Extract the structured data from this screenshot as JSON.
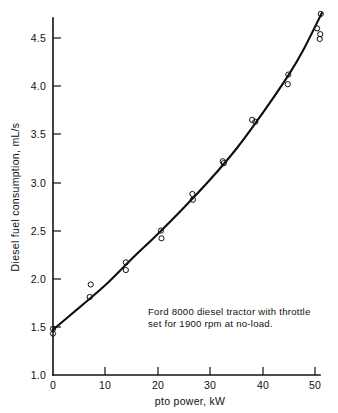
{
  "chart_data": {
    "type": "scatter",
    "title": "",
    "xlabel": "pto power, kW",
    "ylabel": "Diesel fuel consumption, mL/s",
    "xlim": [
      0,
      52
    ],
    "ylim": [
      1.0,
      4.8
    ],
    "xticks": [
      0,
      10,
      20,
      30,
      40,
      50
    ],
    "xtick_labels": [
      "0",
      "10",
      "20",
      "30",
      "40",
      "50"
    ],
    "yticks": [
      1.0,
      1.5,
      2.0,
      2.5,
      3.0,
      3.5,
      4.0,
      4.5
    ],
    "ytick_labels": [
      "1.0",
      "1.5",
      "2.0",
      "2.5",
      "3.0",
      "3.5",
      "4.0",
      "4.5"
    ],
    "grid": false,
    "legend": null,
    "annotations": [
      "Ford 8000 diesel tractor with throttle",
      "set for 1900 rpm at no-load."
    ],
    "points": [
      {
        "x": 0.0,
        "y": 1.48
      },
      {
        "x": 0.0,
        "y": 1.43
      },
      {
        "x": 7.2,
        "y": 1.94
      },
      {
        "x": 7.0,
        "y": 1.81
      },
      {
        "x": 13.9,
        "y": 2.17
      },
      {
        "x": 13.9,
        "y": 2.09
      },
      {
        "x": 20.6,
        "y": 2.5
      },
      {
        "x": 20.7,
        "y": 2.42
      },
      {
        "x": 26.6,
        "y": 2.88
      },
      {
        "x": 26.7,
        "y": 2.82
      },
      {
        "x": 32.4,
        "y": 3.22
      },
      {
        "x": 32.6,
        "y": 3.2
      },
      {
        "x": 38.0,
        "y": 3.65
      },
      {
        "x": 38.6,
        "y": 3.63
      },
      {
        "x": 44.9,
        "y": 4.12
      },
      {
        "x": 44.8,
        "y": 4.02
      },
      {
        "x": 51.1,
        "y": 4.75
      },
      {
        "x": 50.4,
        "y": 4.6
      },
      {
        "x": 51.0,
        "y": 4.54
      },
      {
        "x": 50.9,
        "y": 4.49
      }
    ],
    "fit_curve": [
      {
        "x": 0.0,
        "y": 1.47
      },
      {
        "x": 5.0,
        "y": 1.7
      },
      {
        "x": 10.0,
        "y": 1.935
      },
      {
        "x": 15.0,
        "y": 2.205
      },
      {
        "x": 20.0,
        "y": 2.465
      },
      {
        "x": 25.0,
        "y": 2.74
      },
      {
        "x": 30.0,
        "y": 3.03
      },
      {
        "x": 35.0,
        "y": 3.35
      },
      {
        "x": 40.0,
        "y": 3.72
      },
      {
        "x": 45.0,
        "y": 4.12
      },
      {
        "x": 48.0,
        "y": 4.4
      },
      {
        "x": 51.3,
        "y": 4.76
      }
    ]
  }
}
